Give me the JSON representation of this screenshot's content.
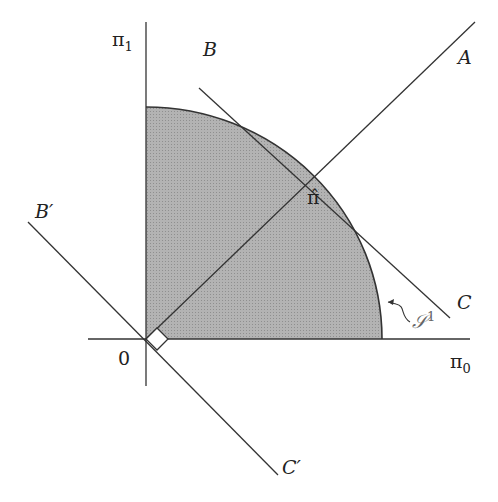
{
  "labels": {
    "y_axis": "π",
    "y_axis_sub": "1",
    "x_axis": "π",
    "x_axis_sub": "0",
    "origin": "0",
    "A": "A",
    "B": "B",
    "C": "C",
    "B_prime": "B′",
    "C_prime": "C′",
    "pi_hat": "π̂",
    "set": "𝒮",
    "set_sup": "1"
  },
  "colors": {
    "fill": "#a9a9a9",
    "stroke": "#333333"
  }
}
